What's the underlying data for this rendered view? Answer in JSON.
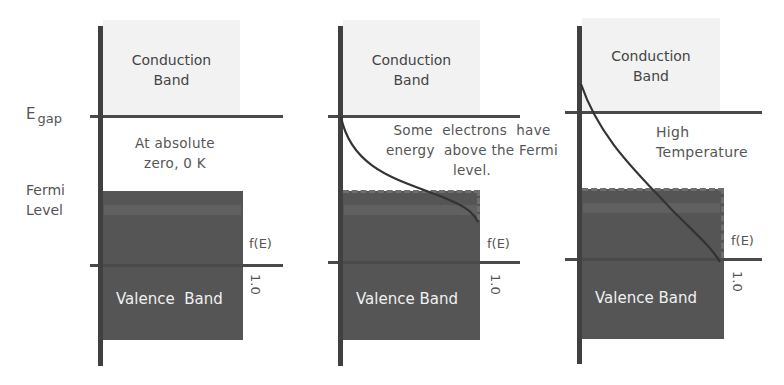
{
  "labels": {
    "egap_main": "E",
    "egap_sub": "gap",
    "fermi_line1": "Fermi",
    "fermi_line2": "Level"
  },
  "panels": [
    {
      "conduction": "Conduction Band",
      "conduction_line1": "Conduction",
      "conduction_line2": "Band",
      "note_lines": [
        "At absolute",
        "zero, 0 K"
      ],
      "valence": "Valence  Band",
      "f_label": "f(E)",
      "one_label": "1.0"
    },
    {
      "conduction": "Conduction Band",
      "conduction_line1": "Conduction",
      "conduction_line2": "Band",
      "note_lines": [
        "Some  electrons  have",
        "energy  above the Fermi",
        "level."
      ],
      "valence": "Valence Band",
      "f_label": "f(E)",
      "one_label": "1.0"
    },
    {
      "conduction": "Conduction Band",
      "conduction_line1": "Conduction",
      "conduction_line2": "Band",
      "note_lines": [
        "High",
        "Temperature"
      ],
      "valence": "Valence Band",
      "f_label": "f(E)",
      "one_label": "1.0"
    }
  ],
  "colors": {
    "conduction_fill": "#f2f2f2",
    "valence_fill": "#555555",
    "axis": "#404040",
    "curve": "#333333"
  }
}
